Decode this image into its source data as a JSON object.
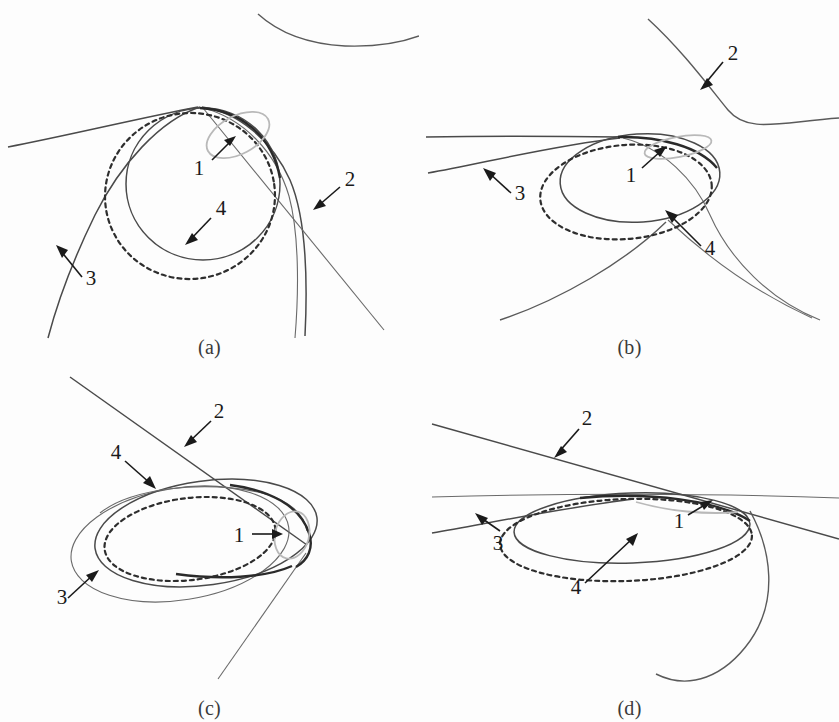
{
  "figure": {
    "title": "",
    "background_color": "#fdfdfd",
    "panel_count": 4,
    "colors": {
      "curve_dark": "#4a4a4a",
      "curve_bold": "#2a2a2a",
      "curve_dashed": "#2e2e2e",
      "curve_gray_highlight": "#b9b9b9",
      "leader_line": "#1a1a1a",
      "label_text": "#1a1a1a"
    },
    "legend_numbers": [
      "1",
      "2",
      "3",
      "4"
    ]
  },
  "panels": [
    {
      "id": "a",
      "caption": "(a)",
      "labels": [
        {
          "number": "1",
          "x": 205,
          "y": 168
        },
        {
          "number": "2",
          "x": 345,
          "y": 184
        },
        {
          "number": "3",
          "x": 86,
          "y": 279
        },
        {
          "number": "4",
          "x": 215,
          "y": 215
        }
      ]
    },
    {
      "id": "b",
      "caption": "(b)",
      "labels": [
        {
          "number": "1",
          "x": 633,
          "y": 175
        },
        {
          "number": "2",
          "x": 729,
          "y": 62
        },
        {
          "number": "3",
          "x": 508,
          "y": 190
        },
        {
          "number": "4",
          "x": 707,
          "y": 250
        }
      ]
    },
    {
      "id": "c",
      "caption": "(c)",
      "labels": [
        {
          "number": "1",
          "x": 239,
          "y": 534
        },
        {
          "number": "2",
          "x": 216,
          "y": 418
        },
        {
          "number": "3",
          "x": 74,
          "y": 596
        },
        {
          "number": "4",
          "x": 116,
          "y": 459
        }
      ]
    },
    {
      "id": "d",
      "caption": "(d)",
      "labels": [
        {
          "number": "1",
          "x": 679,
          "y": 521
        },
        {
          "number": "2",
          "x": 584,
          "y": 426
        },
        {
          "number": "3",
          "x": 496,
          "y": 543
        },
        {
          "number": "4",
          "x": 576,
          "y": 590
        }
      ]
    }
  ],
  "captions": {
    "a": "(a)",
    "b": "(b)",
    "c": "(c)",
    "d": "(d)"
  },
  "numbers": {
    "one": "1",
    "two": "2",
    "three": "3",
    "four": "4"
  }
}
